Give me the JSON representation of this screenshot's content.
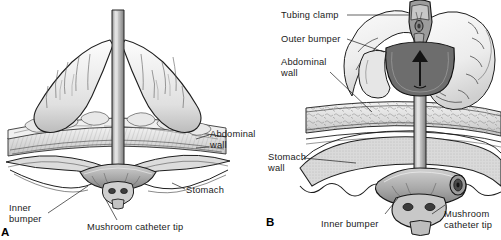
{
  "figure": {
    "type": "medical-illustration",
    "background_color": "#ffffff",
    "ink_color": "#1a1a1a"
  },
  "panels": [
    {
      "id": "A",
      "letter": "A",
      "labels": [
        {
          "id": "abdominal-wall",
          "text": "Abdominal\nwall"
        },
        {
          "id": "stomach",
          "text": "Stomach"
        },
        {
          "id": "inner-bumper",
          "text": "Inner\nbumper"
        },
        {
          "id": "mushroom-catheter-tip",
          "text": "Mushroom catheter tip"
        }
      ]
    },
    {
      "id": "B",
      "letter": "B",
      "labels": [
        {
          "id": "tubing-clamp",
          "text": "Tubing clamp"
        },
        {
          "id": "outer-bumper",
          "text": "Outer bumper"
        },
        {
          "id": "abdominal-wall",
          "text": "Abdominal\nwall"
        },
        {
          "id": "stomach-wall",
          "text": "Stomach\nwall"
        },
        {
          "id": "inner-bumper",
          "text": "Inner bumper"
        },
        {
          "id": "mushroom-catheter-tip",
          "text": "Mushroom\ncatheter tip"
        }
      ]
    }
  ],
  "labels_flat": {
    "a_abdominal_wall_line1": "Abdominal",
    "a_abdominal_wall_line2": "wall",
    "a_stomach": "Stomach",
    "a_inner_bumper_line1": "Inner",
    "a_inner_bumper_line2": "bumper",
    "a_mushroom_catheter_tip": "Mushroom catheter tip",
    "a_letter": "A",
    "b_tubing_clamp": "Tubing clamp",
    "b_outer_bumper": "Outer bumper",
    "b_abdominal_wall_line1": "Abdominal",
    "b_abdominal_wall_line2": "wall",
    "b_stomach_wall_line1": "Stomach",
    "b_stomach_wall_line2": "wall",
    "b_inner_bumper": "Inner bumper",
    "b_mushroom_line1": "Mushroom",
    "b_mushroom_line2": "catheter tip",
    "b_letter": "B"
  },
  "colors": {
    "ink": "#1a1a1a",
    "tissue_light": "#ebebeb",
    "tissue_mid": "#c9c9c9",
    "tissue_dark": "#9a9a9a",
    "bumper_dark": "#6e6e6e",
    "skin": "#f2f2f2",
    "stomach_fill": "#d8d8d8",
    "hole_dark": "#3a3a3a"
  }
}
